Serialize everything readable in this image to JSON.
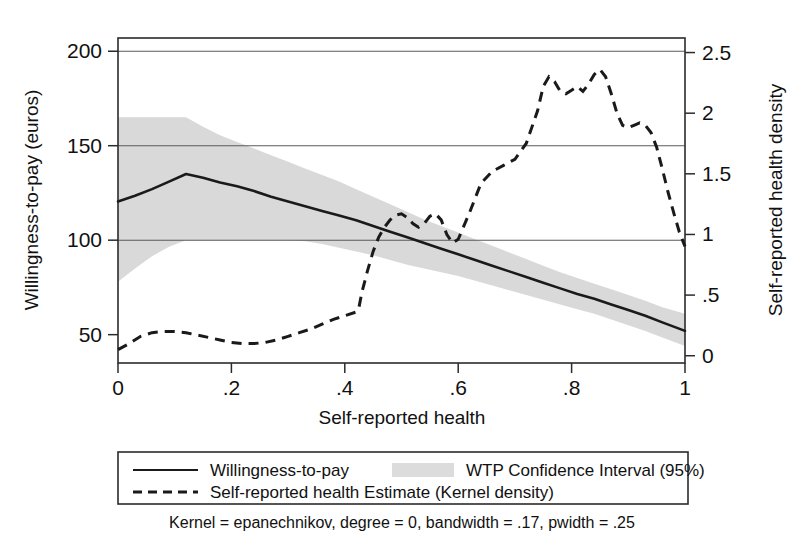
{
  "chart_data": {
    "type": "line",
    "title": "",
    "subtitle": "",
    "xlabel": "Self-reported health",
    "ylabel": "Willingness-to-pay (euros)",
    "y2label": "Self-reported health density",
    "xlim": [
      0,
      1
    ],
    "ylim": [
      35,
      207
    ],
    "y2lim": [
      -0.06,
      2.62
    ],
    "grid": true,
    "legend_position": "below-plot",
    "x_ticks": [
      "0",
      ".2",
      ".4",
      ".6",
      ".8",
      "1"
    ],
    "x_tick_values": [
      0,
      0.2,
      0.4,
      0.6,
      0.8,
      1
    ],
    "y_ticks": [
      "50",
      "100",
      "150",
      "200"
    ],
    "y_tick_values": [
      50,
      100,
      150,
      200
    ],
    "y2_ticks": [
      "0",
      ".5",
      "1",
      "1.5",
      "2",
      "2.5"
    ],
    "y2_tick_values": [
      0,
      0.5,
      1,
      1.5,
      2,
      2.5
    ],
    "gridline_values": [
      100,
      150,
      200
    ],
    "footnote": "Kernel = epanechnikov, degree = 0, bandwidth = .17, pwidth = .25",
    "legend": [
      {
        "label": "Willingness-to-pay",
        "style": "solid-line",
        "color": "#1a1a1a"
      },
      {
        "label": "WTP Confidence Interval (95%)",
        "style": "shaded-band",
        "color": "#dcdcdc"
      },
      {
        "label": "Self-reported health Estimate (Kernel density)",
        "style": "dashed-line",
        "color": "#1a1a1a"
      }
    ],
    "series": [
      {
        "name": "Willingness-to-pay",
        "axis": "left",
        "style": "solid",
        "x": [
          0.0,
          0.03,
          0.06,
          0.09,
          0.12,
          0.15,
          0.18,
          0.21,
          0.24,
          0.27,
          0.3,
          0.33,
          0.36,
          0.39,
          0.42,
          0.45,
          0.48,
          0.51,
          0.54,
          0.57,
          0.6,
          0.63,
          0.66,
          0.69,
          0.72,
          0.75,
          0.78,
          0.81,
          0.84,
          0.87,
          0.9,
          0.93,
          0.96,
          1.0
        ],
        "values": [
          120.5,
          123.5,
          127.0,
          131.0,
          135.0,
          133.0,
          130.5,
          128.5,
          126.0,
          123.0,
          120.5,
          118.0,
          115.5,
          113.0,
          110.5,
          107.5,
          104.5,
          101.5,
          98.5,
          95.5,
          92.5,
          89.5,
          86.5,
          83.5,
          80.5,
          77.5,
          74.5,
          71.5,
          69.0,
          66.0,
          63.0,
          60.0,
          56.5,
          52.0
        ]
      },
      {
        "name": "WTP Confidence Interval (95%) upper",
        "axis": "left",
        "style": "band-upper",
        "x": [
          0.0,
          0.03,
          0.06,
          0.09,
          0.12,
          0.15,
          0.18,
          0.21,
          0.24,
          0.27,
          0.3,
          0.33,
          0.36,
          0.39,
          0.42,
          0.45,
          0.48,
          0.51,
          0.54,
          0.57,
          0.6,
          0.63,
          0.66,
          0.69,
          0.72,
          0.75,
          0.78,
          0.81,
          0.84,
          0.87,
          0.9,
          0.93,
          0.96,
          1.0
        ],
        "values": [
          165.0,
          165.0,
          165.0,
          165.0,
          165.0,
          160.0,
          155.5,
          152.0,
          148.5,
          145.0,
          141.5,
          138.0,
          134.5,
          131.0,
          127.0,
          123.0,
          119.0,
          115.0,
          111.0,
          107.5,
          104.0,
          100.5,
          97.0,
          93.5,
          90.0,
          86.5,
          83.0,
          80.0,
          77.0,
          74.0,
          71.0,
          68.0,
          64.5,
          61.0
        ]
      },
      {
        "name": "WTP Confidence Interval (95%) lower",
        "axis": "left",
        "style": "band-lower",
        "x": [
          0.0,
          0.03,
          0.06,
          0.09,
          0.12,
          0.15,
          0.18,
          0.21,
          0.24,
          0.27,
          0.3,
          0.33,
          0.36,
          0.39,
          0.42,
          0.45,
          0.48,
          0.51,
          0.54,
          0.57,
          0.6,
          0.63,
          0.66,
          0.69,
          0.72,
          0.75,
          0.78,
          0.81,
          0.84,
          0.87,
          0.9,
          0.93,
          0.96,
          1.0
        ],
        "values": [
          78.0,
          85.0,
          91.5,
          96.5,
          100.0,
          100.0,
          100.0,
          100.0,
          100.0,
          100.0,
          100.0,
          99.5,
          98.0,
          96.0,
          94.0,
          92.0,
          89.5,
          87.0,
          85.0,
          83.0,
          81.0,
          78.5,
          76.0,
          73.5,
          71.0,
          68.5,
          66.0,
          63.5,
          61.0,
          58.0,
          55.0,
          52.0,
          48.5,
          44.0
        ]
      },
      {
        "name": "Self-reported health Estimate (Kernel density)",
        "axis": "right",
        "style": "dashed",
        "x": [
          0.0,
          0.02,
          0.04,
          0.06,
          0.08,
          0.1,
          0.12,
          0.14,
          0.16,
          0.18,
          0.2,
          0.22,
          0.24,
          0.26,
          0.28,
          0.3,
          0.32,
          0.34,
          0.36,
          0.38,
          0.4,
          0.42,
          0.425,
          0.43,
          0.44,
          0.45,
          0.46,
          0.47,
          0.48,
          0.49,
          0.5,
          0.51,
          0.52,
          0.53,
          0.54,
          0.55,
          0.56,
          0.57,
          0.58,
          0.59,
          0.6,
          0.62,
          0.64,
          0.66,
          0.68,
          0.7,
          0.72,
          0.74,
          0.75,
          0.76,
          0.77,
          0.78,
          0.79,
          0.8,
          0.81,
          0.82,
          0.83,
          0.84,
          0.85,
          0.86,
          0.87,
          0.88,
          0.89,
          0.9,
          0.91,
          0.92,
          0.93,
          0.94,
          0.95,
          0.96,
          0.97,
          0.98,
          0.99,
          1.0
        ],
        "values": [
          0.05,
          0.1,
          0.16,
          0.19,
          0.2,
          0.2,
          0.19,
          0.17,
          0.15,
          0.13,
          0.11,
          0.1,
          0.1,
          0.11,
          0.13,
          0.16,
          0.19,
          0.22,
          0.26,
          0.3,
          0.33,
          0.36,
          0.4,
          0.52,
          0.7,
          0.86,
          0.98,
          1.06,
          1.12,
          1.16,
          1.17,
          1.14,
          1.09,
          1.06,
          1.09,
          1.15,
          1.17,
          1.12,
          1.0,
          0.93,
          0.96,
          1.18,
          1.42,
          1.52,
          1.57,
          1.62,
          1.75,
          2.02,
          2.22,
          2.3,
          2.26,
          2.18,
          2.16,
          2.19,
          2.22,
          2.18,
          2.24,
          2.32,
          2.36,
          2.3,
          2.16,
          2.0,
          1.9,
          1.88,
          1.9,
          1.92,
          1.9,
          1.84,
          1.72,
          1.54,
          1.35,
          1.18,
          1.02,
          0.9
        ]
      }
    ]
  }
}
